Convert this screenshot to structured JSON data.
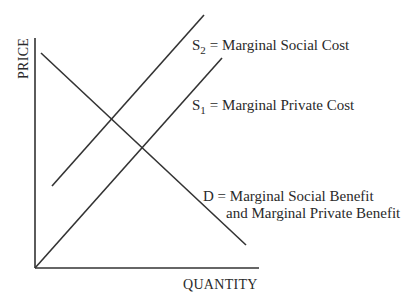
{
  "diagram": {
    "type": "supply-demand-externality",
    "axes": {
      "y_label": "PRICE",
      "x_label": "QUANTITY"
    },
    "curves": [
      {
        "id": "S2",
        "symbol": "S",
        "subscript": "2",
        "label": "= Marginal Social Cost",
        "slope": "upward"
      },
      {
        "id": "S1",
        "symbol": "S",
        "subscript": "1",
        "label": "= Marginal Private Cost",
        "slope": "upward"
      },
      {
        "id": "D",
        "symbol": "D",
        "label_line1": "D = Marginal Social Benefit",
        "label_line2": "and Marginal Private Benefit",
        "slope": "downward"
      }
    ],
    "line_color": "#333333",
    "background": "#ffffff"
  }
}
